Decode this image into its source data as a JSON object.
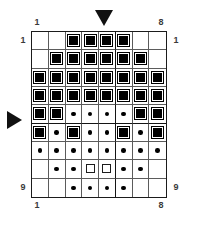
{
  "figure": {
    "type": "go-board-diagram",
    "board": {
      "columns": 8,
      "rows": 9,
      "heavy_line_after_column": 5,
      "heavy_line_after_row": 5,
      "cells": [
        [
          "empty",
          "empty",
          "filled",
          "filled",
          "filled",
          "filled",
          "empty",
          "empty"
        ],
        [
          "empty",
          "filled",
          "filled",
          "filled",
          "filled",
          "filled",
          "filled",
          "empty"
        ],
        [
          "filled",
          "filled",
          "filled",
          "filled",
          "filled",
          "filled",
          "filled",
          "filled"
        ],
        [
          "filled",
          "filled",
          "filled",
          "filled",
          "filled",
          "filled",
          "filled",
          "filled"
        ],
        [
          "filled",
          "filled",
          "dot",
          "dot",
          "dot",
          "dot",
          "filled",
          "filled"
        ],
        [
          "filled",
          "dot",
          "filled",
          "dot",
          "dot",
          "filled",
          "dot",
          "filled"
        ],
        [
          "dot",
          "dot",
          "dot",
          "dot",
          "dot",
          "dot",
          "dot",
          "dot"
        ],
        [
          "empty",
          "dot",
          "dot",
          "open",
          "open",
          "dot",
          "dot",
          "empty"
        ],
        [
          "empty",
          "empty",
          "dot",
          "dot",
          "dot",
          "dot",
          "empty",
          "empty"
        ]
      ]
    },
    "labels": {
      "top_left": "1",
      "top_right": "8",
      "bottom_left": "1",
      "bottom_right": "8",
      "left_top": "1",
      "left_bottom": "9",
      "right_top": "1",
      "right_bottom": "9"
    },
    "markers": {
      "top_pointer": "down-triangle",
      "left_pointer": "right-triangle"
    },
    "colors": {
      "filled": "#000000",
      "open": "#ffffff",
      "dot": "#000000",
      "grid": "#5b5b5b",
      "border": "#1b1b1b",
      "marker": "#111111"
    }
  }
}
